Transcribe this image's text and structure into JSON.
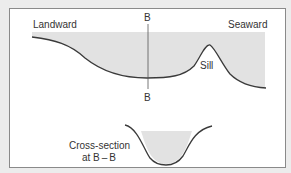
{
  "labels": {
    "landward": "Landward",
    "seaward": "Seaward",
    "section_top": "B",
    "section_bottom": "B",
    "sill": "Sill",
    "cross_section_line1": "Cross-section",
    "cross_section_line2": "at B – B"
  },
  "colors": {
    "water": "#e2e2e2",
    "line": "#3a3a3a",
    "frame": "#8a8a8a"
  }
}
